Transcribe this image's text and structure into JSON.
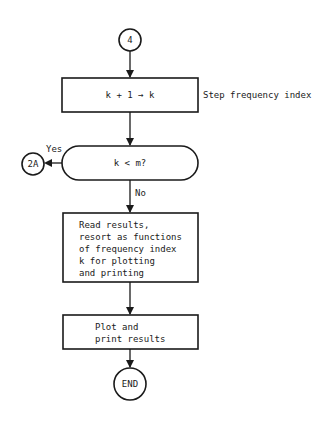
{
  "flowchart": {
    "start_connector": {
      "label": "4"
    },
    "step_box": {
      "label": "k + 1 → k",
      "annotation": "Step frequency index"
    },
    "decision": {
      "label": "k < m?",
      "yes_label": "Yes",
      "no_label": "No"
    },
    "yes_connector": {
      "label": "2A"
    },
    "read_box": {
      "lines": [
        "Read results,",
        "resort as functions",
        "of frequency index",
        "k for plotting",
        "and printing"
      ]
    },
    "plot_box": {
      "lines": [
        "Plot and",
        "print results"
      ]
    },
    "end_terminal": {
      "label": "END"
    }
  }
}
